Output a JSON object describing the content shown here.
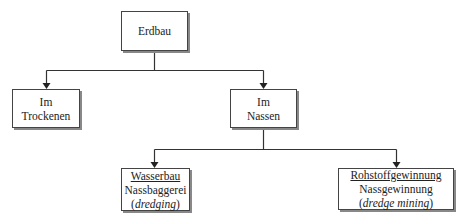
{
  "diagram": {
    "root": {
      "label": "Erdbau"
    },
    "level1": [
      {
        "line1": "Im",
        "line2": "Trockenen"
      },
      {
        "line1": "Im",
        "line2": "Nassen"
      }
    ],
    "level2": [
      {
        "title": "Wasserbau",
        "subtitle": "Nassbaggerei",
        "english_open": "(",
        "english": "dredging",
        "english_close": ")"
      },
      {
        "title": "Rohstoffgewinnung",
        "subtitle": "Nassgewinnung",
        "english_open": "(",
        "english": "dredge mining",
        "english_close": ")"
      }
    ]
  }
}
